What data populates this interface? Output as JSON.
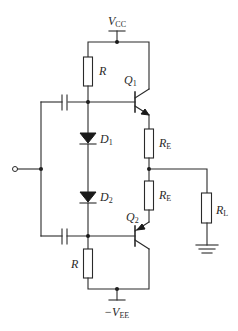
{
  "diagram": {
    "type": "circuit-schematic",
    "labels": {
      "vcc": {
        "main": "V",
        "sub": "CC"
      },
      "vee": {
        "prefix": "−",
        "main": "V",
        "sub": "EE"
      },
      "r_top": "R",
      "r_bottom": "R",
      "q1": {
        "main": "Q",
        "sub": "1"
      },
      "q2": {
        "main": "Q",
        "sub": "2"
      },
      "d1": {
        "main": "D",
        "sub": "1"
      },
      "d2": {
        "main": "D",
        "sub": "2"
      },
      "re_top": {
        "main": "R",
        "sub": "E"
      },
      "re_bottom": {
        "main": "R",
        "sub": "E"
      },
      "rl": {
        "main": "R",
        "sub": "L"
      }
    },
    "components": [
      {
        "id": "R_top",
        "kind": "resistor",
        "label": "R"
      },
      {
        "id": "R_bottom",
        "kind": "resistor",
        "label": "R"
      },
      {
        "id": "Q1",
        "kind": "npn-transistor",
        "label": "Q1"
      },
      {
        "id": "Q2",
        "kind": "pnp-transistor",
        "label": "Q2"
      },
      {
        "id": "D1",
        "kind": "diode",
        "label": "D1"
      },
      {
        "id": "D2",
        "kind": "diode",
        "label": "D2"
      },
      {
        "id": "RE_top",
        "kind": "resistor",
        "label": "RE"
      },
      {
        "id": "RE_bottom",
        "kind": "resistor",
        "label": "RE"
      },
      {
        "id": "RL",
        "kind": "resistor",
        "label": "RL"
      },
      {
        "id": "C_top",
        "kind": "capacitor",
        "label": ""
      },
      {
        "id": "C_bottom",
        "kind": "capacitor",
        "label": ""
      },
      {
        "id": "input",
        "kind": "terminal",
        "label": ""
      },
      {
        "id": "GND",
        "kind": "ground",
        "label": ""
      }
    ]
  }
}
